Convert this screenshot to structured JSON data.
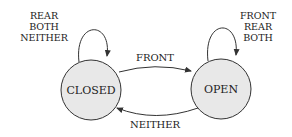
{
  "diagram": {
    "type": "state-machine",
    "states": [
      {
        "id": "closed",
        "label": "CLOSED",
        "fill": "#e8e8e8"
      },
      {
        "id": "open",
        "label": "OPEN",
        "fill": "#e8e8e8"
      }
    ],
    "transitions": [
      {
        "from": "closed",
        "to": "open",
        "label": "FRONT"
      },
      {
        "from": "open",
        "to": "closed",
        "label": "NEITHER"
      },
      {
        "from": "closed",
        "to": "closed",
        "labels": [
          "REAR",
          "BOTH",
          "NEITHER"
        ]
      },
      {
        "from": "open",
        "to": "open",
        "labels": [
          "FRONT",
          "REAR",
          "BOTH"
        ]
      }
    ]
  }
}
